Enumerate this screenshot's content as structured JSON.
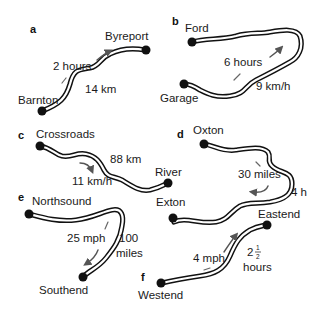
{
  "panels": [
    {
      "letter": "a",
      "start": "Barnton",
      "end": "Byreport",
      "time": "2 hours",
      "distance": "14 km"
    },
    {
      "letter": "b",
      "start": "Garage",
      "end": "Ford",
      "time": "6 hours",
      "speed": "9 km/h"
    },
    {
      "letter": "c",
      "start": "Crossroads",
      "end": "River",
      "distance": "88 km",
      "speed": "11 km/h"
    },
    {
      "letter": "d",
      "start": "Oxton",
      "end": "Exton",
      "distance": "30 miles",
      "time": "4 h"
    },
    {
      "letter": "e",
      "start": "Northsound",
      "end": "Southend",
      "speed": "25 mph",
      "distance_value": "100",
      "distance_unit": "miles"
    },
    {
      "letter": "f",
      "start": "Westend",
      "end": "Eastend",
      "speed": "4 mph",
      "time_whole": "2",
      "time_frac_num": "1",
      "time_frac_den": "2",
      "time_unit": "hours"
    }
  ]
}
